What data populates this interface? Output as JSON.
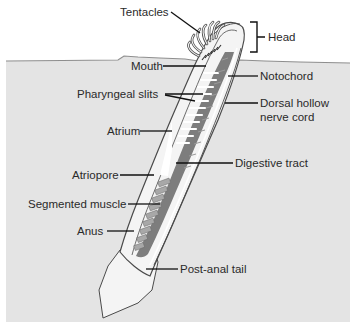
{
  "diagram": {
    "colors": {
      "background": "#ffffff",
      "sand": "#e4e4e4",
      "sand_edge": "#8e8e8e",
      "body_outline": "#4a4a4a",
      "body_fill": "#f4f4f4",
      "inner_tissue": "#7d7d7d",
      "muscle": "#a8a8a8",
      "slits": "#ffffff",
      "leader_line": "#111111",
      "label_text": "#2a2a2a"
    },
    "labels": {
      "tentacles": "Tentacles",
      "head": "Head",
      "mouth": "Mouth",
      "notochord": "Notochord",
      "pharyngeal_slits": "Pharyngeal slits",
      "dorsal_hollow_line1": "Dorsal hollow",
      "dorsal_hollow_line2": "nerve cord",
      "atrium": "Atrium",
      "digestive_tract": "Digestive tract",
      "atriopore": "Atriopore",
      "segmented_muscle": "Segmented muscle",
      "anus": "Anus",
      "post_anal_tail": "Post-anal tail"
    }
  }
}
